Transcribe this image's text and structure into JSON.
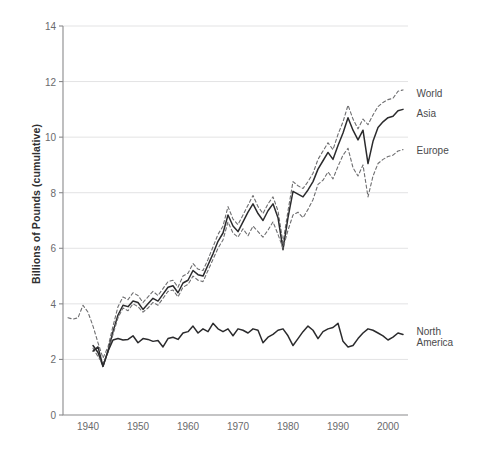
{
  "chart_data": {
    "type": "line",
    "title": "",
    "subtitle": "",
    "xlabel": "",
    "ylabel": "Billions of Pounds (cumulative)",
    "xlim": [
      1935,
      2004
    ],
    "ylim": [
      0,
      14
    ],
    "xticks": [
      1940,
      1950,
      1960,
      1970,
      1980,
      1990,
      2000
    ],
    "yticks": [
      0,
      2,
      4,
      6,
      8,
      10,
      12,
      14
    ],
    "grid": "horizontal",
    "legend_position": "right-inline-labels",
    "x": [
      1936,
      1937,
      1938,
      1939,
      1940,
      1941,
      1942,
      1943,
      1944,
      1945,
      1946,
      1947,
      1948,
      1949,
      1950,
      1951,
      1952,
      1953,
      1954,
      1955,
      1956,
      1957,
      1958,
      1959,
      1960,
      1961,
      1962,
      1963,
      1964,
      1965,
      1966,
      1967,
      1968,
      1969,
      1970,
      1971,
      1972,
      1973,
      1974,
      1975,
      1976,
      1977,
      1978,
      1979,
      1980,
      1981,
      1982,
      1983,
      1984,
      1985,
      1986,
      1987,
      1988,
      1989,
      1990,
      1991,
      1992,
      1993,
      1994,
      1995,
      1996,
      1997,
      1998,
      1999,
      2000,
      2001,
      2002,
      2003
    ],
    "series": [
      {
        "name": "World",
        "style": "dashed",
        "color": "#6e6e70",
        "values": [
          3.5,
          3.45,
          3.5,
          3.95,
          3.7,
          3.2,
          2.6,
          2.05,
          2.45,
          3.2,
          3.9,
          4.25,
          4.15,
          4.4,
          4.3,
          4.05,
          4.25,
          4.45,
          4.3,
          4.55,
          4.8,
          4.85,
          4.6,
          5.0,
          5.1,
          5.45,
          5.25,
          5.2,
          5.6,
          6.05,
          6.5,
          6.8,
          7.5,
          7.05,
          6.85,
          7.2,
          7.55,
          7.9,
          7.5,
          7.25,
          7.6,
          7.85,
          7.35,
          6.2,
          7.35,
          8.4,
          8.25,
          8.15,
          8.4,
          8.7,
          9.2,
          9.5,
          9.8,
          9.55,
          10.1,
          10.55,
          11.15,
          10.65,
          10.3,
          10.65,
          10.45,
          10.8,
          11.1,
          11.25,
          11.35,
          11.4,
          11.65,
          11.7
        ]
      },
      {
        "name": "Asia",
        "style": "solid",
        "color": "#2b2b2d",
        "values": [
          null,
          null,
          null,
          null,
          null,
          2.5,
          2.25,
          1.75,
          2.3,
          3.0,
          3.6,
          3.95,
          3.9,
          4.1,
          4.05,
          3.8,
          4.0,
          4.2,
          4.1,
          4.35,
          4.6,
          4.65,
          4.4,
          4.75,
          4.85,
          5.2,
          5.05,
          5.0,
          5.4,
          5.8,
          6.25,
          6.55,
          7.2,
          6.8,
          6.6,
          6.95,
          7.3,
          7.6,
          7.25,
          7.0,
          7.35,
          7.6,
          7.1,
          5.95,
          7.1,
          8.05,
          7.95,
          7.85,
          8.1,
          8.4,
          8.85,
          9.15,
          9.45,
          9.2,
          9.7,
          10.15,
          10.7,
          10.25,
          9.9,
          10.25,
          9.05,
          9.85,
          10.35,
          10.55,
          10.7,
          10.75,
          10.95,
          11.0
        ]
      },
      {
        "name": "Europe",
        "style": "dashed",
        "color": "#6e6e70",
        "values": [
          null,
          null,
          null,
          null,
          null,
          2.4,
          2.1,
          1.85,
          2.25,
          2.9,
          3.5,
          3.85,
          3.75,
          4.0,
          3.9,
          3.7,
          3.85,
          4.05,
          3.95,
          4.2,
          4.45,
          4.5,
          4.25,
          4.6,
          4.7,
          5.0,
          4.85,
          4.8,
          5.2,
          5.6,
          6.0,
          6.3,
          6.95,
          6.55,
          6.4,
          6.7,
          6.45,
          6.8,
          6.6,
          6.4,
          6.65,
          6.95,
          6.5,
          6.0,
          6.65,
          7.2,
          7.3,
          7.1,
          7.4,
          7.75,
          8.3,
          8.45,
          8.75,
          8.5,
          8.95,
          9.35,
          9.6,
          8.9,
          8.6,
          9.0,
          7.85,
          8.6,
          9.05,
          9.2,
          9.3,
          9.35,
          9.5,
          9.55
        ]
      },
      {
        "name": "North America",
        "style": "solid",
        "color": "#2b2b2d",
        "values": [
          null,
          null,
          null,
          null,
          null,
          2.3,
          2.45,
          1.75,
          2.3,
          2.7,
          2.75,
          2.7,
          2.72,
          2.85,
          2.6,
          2.75,
          2.72,
          2.65,
          2.68,
          2.45,
          2.75,
          2.8,
          2.72,
          2.95,
          3.0,
          3.2,
          2.95,
          3.1,
          3.0,
          3.3,
          3.1,
          3.0,
          3.1,
          2.85,
          3.1,
          3.05,
          2.95,
          3.1,
          3.05,
          2.6,
          2.8,
          2.9,
          3.05,
          3.1,
          2.85,
          2.5,
          2.75,
          3.0,
          3.2,
          3.05,
          2.75,
          3.0,
          3.1,
          3.15,
          3.3,
          2.65,
          2.45,
          2.5,
          2.75,
          2.95,
          3.1,
          3.05,
          2.95,
          2.85,
          2.7,
          2.8,
          2.95,
          2.9
        ]
      }
    ],
    "series_labels": [
      {
        "name": "World",
        "text": "World",
        "x": 2004.5,
        "y": 11.55
      },
      {
        "name": "Asia",
        "text": "Asia",
        "x": 2004.5,
        "y": 10.85
      },
      {
        "name": "Europe",
        "text": "Europe",
        "x": 2004.5,
        "y": 9.5
      },
      {
        "name": "North America",
        "text": "North\nAmerica",
        "x": 2004.5,
        "y": 3.0
      }
    ],
    "colors": {
      "axis": "#8a8a8c",
      "grid": "#e3e3e4",
      "solid_line": "#2b2b2d",
      "dashed_line": "#6e6e70",
      "tick_text": "#6a6a6c",
      "axis_title": "#2f2f31",
      "background": "#ffffff"
    }
  }
}
